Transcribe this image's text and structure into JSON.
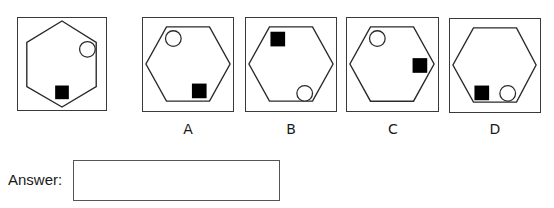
{
  "question": {
    "figure": {
      "hexagon_orientation": "pointy-top",
      "circle": {
        "cx": 71,
        "cy": 32,
        "r": 8,
        "position": "upper-right"
      },
      "square": {
        "x": 38,
        "y": 69,
        "size": 14,
        "position": "bottom"
      }
    }
  },
  "options": [
    {
      "label": "A",
      "hexagon_orientation": "flat-top",
      "circle": {
        "cx": 31,
        "cy": 21,
        "r": 8
      },
      "square": {
        "x": 50,
        "y": 67,
        "size": 15
      }
    },
    {
      "label": "B",
      "hexagon_orientation": "flat-top",
      "circle": {
        "cx": 60,
        "cy": 77,
        "r": 8
      },
      "square": {
        "x": 25,
        "y": 14,
        "size": 15
      }
    },
    {
      "label": "C",
      "hexagon_orientation": "flat-top",
      "circle": {
        "cx": 31,
        "cy": 21,
        "r": 8
      },
      "square": {
        "x": 67,
        "y": 41,
        "size": 15
      }
    },
    {
      "label": "D",
      "hexagon_orientation": "flat-top",
      "circle": {
        "cx": 59,
        "cy": 76,
        "r": 8
      },
      "square": {
        "x": 25,
        "y": 68,
        "size": 15
      }
    }
  ],
  "answer": {
    "label": "Answer:",
    "value": "",
    "placeholder": ""
  },
  "colors": {
    "stroke": "#2a2a2a",
    "fill_square": "#000000",
    "background": "#ffffff"
  }
}
